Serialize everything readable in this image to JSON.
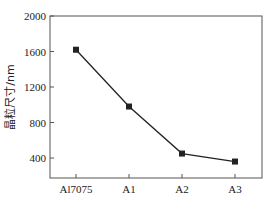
{
  "chart_data": {
    "type": "line",
    "title": "",
    "xlabel": "",
    "ylabel": "晶粒尺寸/nm",
    "categories": [
      "Al7075",
      "A1",
      "A2",
      "A3"
    ],
    "series": [
      {
        "name": "晶粒尺寸",
        "values": [
          1620,
          980,
          450,
          360
        ],
        "marker": "square",
        "color": "#222222"
      }
    ],
    "ylim": [
      190,
      2000
    ],
    "yticks": [
      400,
      800,
      1200,
      1600,
      2000
    ],
    "ytick_labels": [
      "400",
      "800",
      "1200",
      "1600",
      "2000"
    ],
    "grid": false,
    "legend": "none"
  },
  "axes": {
    "ylabel": "晶粒尺寸/nm",
    "x_ticks": [
      "Al7075",
      "A1",
      "A2",
      "A3"
    ],
    "y_ticks": [
      "2000",
      "1600",
      "1200",
      "800",
      "400"
    ]
  },
  "colors": {
    "line": "#222222",
    "axis": "#555555",
    "text": "#222222"
  }
}
